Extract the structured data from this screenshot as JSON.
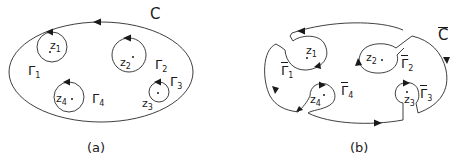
{
  "panel_a": {
    "caption": "(a)",
    "outer_contour": "C",
    "contours": [
      {
        "name": "Γ",
        "sub": "1"
      },
      {
        "name": "Γ",
        "sub": "2"
      },
      {
        "name": "Γ",
        "sub": "3"
      },
      {
        "name": "Γ",
        "sub": "4"
      }
    ],
    "points": [
      {
        "name": "z",
        "sub": "1"
      },
      {
        "name": "z",
        "sub": "2"
      },
      {
        "name": "z",
        "sub": "3"
      },
      {
        "name": "z",
        "sub": "4"
      }
    ]
  },
  "panel_b": {
    "caption": "(b)",
    "outer_contour": "C",
    "outer_contour_overline": true,
    "contours": [
      {
        "name": "Γ",
        "sub": "1",
        "overline": true
      },
      {
        "name": "Γ",
        "sub": "2",
        "overline": true
      },
      {
        "name": "Γ",
        "sub": "3",
        "overline": true
      },
      {
        "name": "Γ",
        "sub": "4",
        "overline": true
      }
    ],
    "points": [
      {
        "name": "z",
        "sub": "1"
      },
      {
        "name": "z",
        "sub": "2"
      },
      {
        "name": "z",
        "sub": "3"
      },
      {
        "name": "z",
        "sub": "4"
      }
    ]
  },
  "colors": {
    "stroke": "#2a2a2a",
    "background": "#ffffff"
  }
}
